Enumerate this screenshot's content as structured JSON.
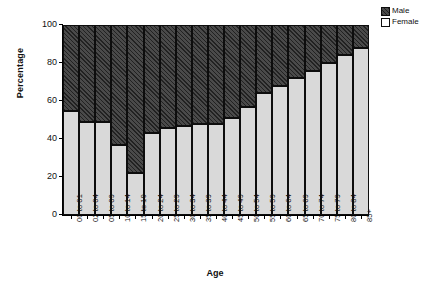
{
  "chart_data": {
    "type": "bar",
    "stacked": true,
    "title": "",
    "xlabel": "Age",
    "ylabel": "Percentage",
    "ylim": [
      0,
      100
    ],
    "yticks": [
      0,
      20,
      40,
      60,
      80,
      100
    ],
    "grid": false,
    "legend_position": "top-right",
    "categories": [
      "00 to 01",
      "02 to 04",
      "05 to 09",
      "10 to 14",
      "15 to 19",
      "20 to 24",
      "25 to 29",
      "30 to 34",
      "35 to 39",
      "40 to 44",
      "45 to 49",
      "50 to 54",
      "55 to 59",
      "60 to 64",
      "65 to 69",
      "70 to 74",
      "75 to 79",
      "80 to 84",
      "85+"
    ],
    "series": [
      {
        "name": "Female",
        "color": "#d9d9d9",
        "values": [
          55,
          49,
          49,
          37,
          22,
          43,
          46,
          47,
          48,
          48,
          51,
          57,
          64,
          68,
          72,
          76,
          80,
          84,
          88
        ]
      },
      {
        "name": "Male",
        "color": "#4a4a4a",
        "values": [
          45,
          51,
          51,
          63,
          78,
          57,
          54,
          53,
          52,
          52,
          49,
          43,
          36,
          32,
          28,
          24,
          20,
          16,
          12
        ]
      }
    ]
  },
  "legend": {
    "items": [
      {
        "label": "Male",
        "key": "male"
      },
      {
        "label": "Female",
        "key": "female"
      }
    ]
  }
}
